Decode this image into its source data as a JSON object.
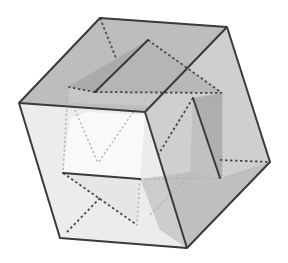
{
  "figure": {
    "title": "Icosahedron inscribed in a cube",
    "colors": {
      "background": "#ffffff",
      "edge_solid": "#3a3a3a",
      "edge_hidden": "#4a4a4a",
      "face_top": "#b9b9b9",
      "face_front": "#ececec",
      "face_right": "#c4c4c4",
      "inner_face_dark": "#9d9d9d",
      "inner_face_mid": "#bdbdbd",
      "inner_face_light": "#dcdcdc",
      "inner_face_white": "#f8f8f8"
    },
    "cube": {
      "vertices": {
        "top_back_left": [
          100,
          18
        ],
        "top_back_right": [
          227,
          27
        ],
        "front_top_left": [
          19,
          103
        ],
        "front_top_right": [
          145,
          112
        ],
        "right_bottom": [
          270,
          162
        ],
        "front_bottom_right": [
          187,
          248
        ],
        "front_bottom_left": [
          60,
          238
        ]
      }
    },
    "inner_solid": {
      "vertices": {
        "top": [
          148,
          40
        ],
        "left_upper": [
          95,
          92
        ],
        "left_outer": [
          68,
          87
        ],
        "right_upper": [
          193,
          98
        ],
        "right_lower": [
          220,
          178
        ],
        "right_outer": [
          222,
          93
        ],
        "bottom_left": [
          63,
          173
        ],
        "bottom_right": [
          140,
          179
        ]
      }
    }
  }
}
